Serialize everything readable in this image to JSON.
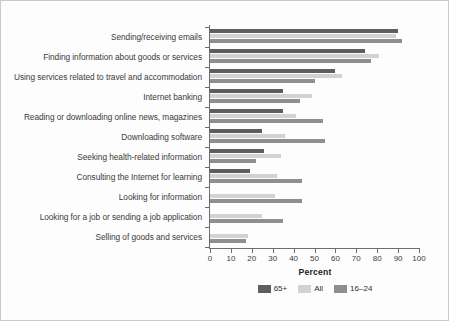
{
  "chart_data": {
    "type": "bar",
    "orientation": "horizontal",
    "title": "",
    "xlabel": "Percent",
    "ylabel": "",
    "xlim": [
      0,
      100
    ],
    "xticks": [
      0,
      10,
      20,
      30,
      40,
      50,
      60,
      70,
      80,
      90,
      100
    ],
    "grid": false,
    "legend_position": "bottom",
    "categories": [
      "Sending/receiving emails",
      "Finding information about goods or services",
      "Using services related to travel and accommodation",
      "Internet banking",
      "Reading or downloading online news, magazines",
      "Downloading software",
      "Seeking health-related information",
      "Consulting the Internet for learning",
      "Looking for information",
      "Looking for a job or sending a job application",
      "Selling of goods and services"
    ],
    "series": [
      {
        "name": "65+",
        "color": "#5e5e5e",
        "values": [
          90,
          74,
          60,
          35,
          35,
          25,
          26,
          19,
          0,
          0,
          0
        ]
      },
      {
        "name": "All",
        "color": "#d2d2d2",
        "values": [
          89,
          81,
          63,
          49,
          41,
          36,
          34,
          32,
          31,
          25,
          18
        ]
      },
      {
        "name": "16–24",
        "color": "#8f8f8f",
        "values": [
          92,
          77,
          50,
          43,
          54,
          55,
          22,
          44,
          44,
          35,
          17
        ]
      }
    ]
  },
  "legend": {
    "items": [
      {
        "label": "65+",
        "color": "#5e5e5e"
      },
      {
        "label": "All",
        "color": "#d2d2d2"
      },
      {
        "label": "16–24",
        "color": "#8f8f8f"
      }
    ]
  }
}
